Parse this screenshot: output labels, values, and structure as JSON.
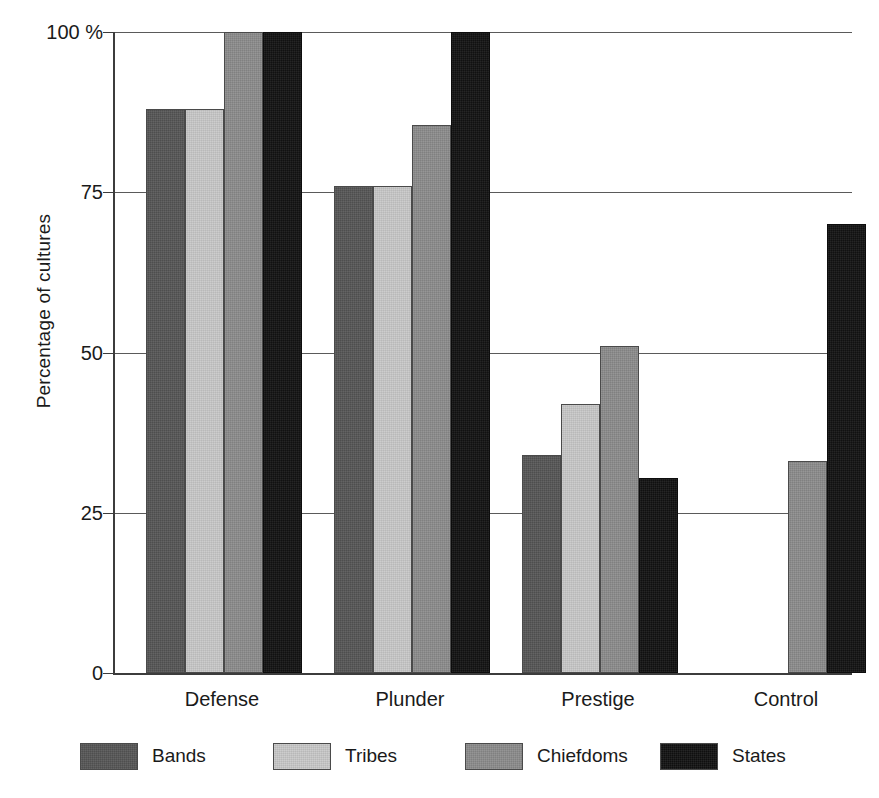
{
  "chart_data": {
    "type": "bar",
    "title": "",
    "subtitle": "",
    "xlabel": "",
    "ylabel": "Percentage of cultures",
    "ylim": [
      0,
      100
    ],
    "yticks": [
      "0",
      "25",
      "50",
      "75",
      "100 %"
    ],
    "ytick_values": [
      0,
      25,
      50,
      75,
      100
    ],
    "grid": true,
    "legend_position": "bottom",
    "categories": [
      "Defense",
      "Plunder",
      "Prestige",
      "Control"
    ],
    "series": [
      {
        "name": "Bands",
        "color": "#565656",
        "values": [
          88,
          76,
          34,
          0
        ]
      },
      {
        "name": "Tribes",
        "color": "#c9c9c9",
        "values": [
          88,
          76,
          42,
          0
        ]
      },
      {
        "name": "Chiefdoms",
        "color": "#8c8c8c",
        "values": [
          100,
          85.5,
          51,
          33
        ]
      },
      {
        "name": "States",
        "color": "#111111",
        "values": [
          100,
          100,
          30.5,
          70
        ]
      }
    ]
  },
  "axis": {
    "y_title": "Percentage of cultures"
  },
  "colors": {
    "axis": "#3c3c3c",
    "gridline": "#5a5a5a",
    "text": "#1a1a1a",
    "background": "#ffffff"
  }
}
